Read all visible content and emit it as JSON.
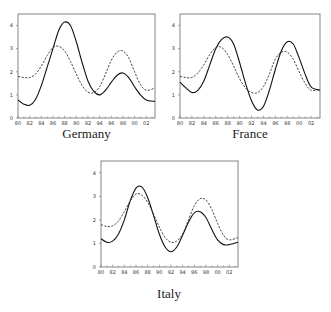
{
  "chart_data": [
    {
      "type": "line",
      "title": "Germany",
      "xlabel": "",
      "ylabel": "",
      "x_ticks": [
        "80",
        "82",
        "84",
        "86",
        "88",
        "90",
        "92",
        "94",
        "96",
        "98",
        "00",
        "02"
      ],
      "y_ticks": [
        0,
        1,
        2,
        3,
        4
      ],
      "xlim": [
        1980,
        2003.5
      ],
      "ylim": [
        0,
        4.5
      ],
      "grid": false,
      "legend": "none",
      "series": [
        {
          "name": "solid",
          "style": "solid",
          "x": [
            1980,
            1981,
            1982,
            1983,
            1984,
            1985,
            1986,
            1987,
            1988,
            1989,
            1990,
            1991,
            1992,
            1993,
            1994,
            1995,
            1996,
            1997,
            1998,
            1999,
            2000,
            2001,
            2002,
            2003.5
          ],
          "values": [
            0.78,
            0.6,
            0.55,
            0.8,
            1.4,
            2.2,
            3.0,
            3.8,
            4.15,
            4.0,
            3.3,
            2.4,
            1.6,
            1.15,
            1.0,
            1.2,
            1.55,
            1.85,
            1.95,
            1.75,
            1.35,
            1.0,
            0.78,
            0.72
          ]
        },
        {
          "name": "dashed",
          "style": "dashed",
          "x": [
            1980,
            1981,
            1982,
            1983,
            1984,
            1985,
            1986,
            1987,
            1988,
            1989,
            1990,
            1991,
            1992,
            1993,
            1994,
            1995,
            1996,
            1997,
            1998,
            1999,
            2000,
            2001,
            2002,
            2003.5
          ],
          "values": [
            1.8,
            1.75,
            1.75,
            1.9,
            2.25,
            2.7,
            3.05,
            3.1,
            2.9,
            2.45,
            1.9,
            1.4,
            1.12,
            1.1,
            1.35,
            1.9,
            2.5,
            2.85,
            2.9,
            2.6,
            2.0,
            1.45,
            1.2,
            1.3
          ]
        }
      ]
    },
    {
      "type": "line",
      "title": "France",
      "xlabel": "",
      "ylabel": "",
      "x_ticks": [
        "80",
        "82",
        "84",
        "86",
        "88",
        "90",
        "92",
        "94",
        "96",
        "98",
        "00",
        "02"
      ],
      "y_ticks": [
        0,
        1,
        2,
        3,
        4
      ],
      "xlim": [
        1980,
        2003.5
      ],
      "ylim": [
        0,
        4.5
      ],
      "grid": false,
      "legend": "none",
      "series": [
        {
          "name": "solid",
          "style": "solid",
          "x": [
            1980,
            1981,
            1982,
            1983,
            1984,
            1985,
            1986,
            1987,
            1988,
            1989,
            1990,
            1991,
            1992,
            1993,
            1994,
            1995,
            1996,
            1997,
            1998,
            1999,
            2000,
            2001,
            2002,
            2003.5
          ],
          "values": [
            1.55,
            1.3,
            1.1,
            1.2,
            1.6,
            2.3,
            3.0,
            3.4,
            3.5,
            3.2,
            2.4,
            1.5,
            0.75,
            0.35,
            0.5,
            1.2,
            2.1,
            2.9,
            3.3,
            3.2,
            2.6,
            1.9,
            1.35,
            1.2
          ]
        },
        {
          "name": "dashed",
          "style": "dashed",
          "x": [
            1980,
            1981,
            1982,
            1983,
            1984,
            1985,
            1986,
            1987,
            1988,
            1989,
            1990,
            1991,
            1992,
            1993,
            1994,
            1995,
            1996,
            1997,
            1998,
            1999,
            2000,
            2001,
            2002,
            2003.5
          ],
          "values": [
            1.8,
            1.75,
            1.75,
            1.95,
            2.3,
            2.75,
            3.05,
            3.05,
            2.75,
            2.25,
            1.7,
            1.3,
            1.1,
            1.1,
            1.35,
            1.9,
            2.55,
            2.85,
            2.85,
            2.55,
            2.0,
            1.5,
            1.2,
            1.25
          ]
        }
      ]
    },
    {
      "type": "line",
      "title": "Italy",
      "xlabel": "",
      "ylabel": "",
      "x_ticks": [
        "80",
        "82",
        "84",
        "86",
        "88",
        "90",
        "92",
        "94",
        "96",
        "98",
        "00",
        "02"
      ],
      "y_ticks": [
        0,
        1,
        2,
        3,
        4
      ],
      "xlim": [
        1980,
        2003.5
      ],
      "ylim": [
        0,
        4.5
      ],
      "grid": false,
      "legend": "none",
      "series": [
        {
          "name": "solid",
          "style": "solid",
          "x": [
            1980,
            1981,
            1982,
            1983,
            1984,
            1985,
            1986,
            1987,
            1988,
            1989,
            1990,
            1991,
            1992,
            1993,
            1994,
            1995,
            1996,
            1997,
            1998,
            1999,
            2000,
            2001,
            2002,
            2003.5
          ],
          "values": [
            1.2,
            1.05,
            1.1,
            1.4,
            2.0,
            2.8,
            3.35,
            3.4,
            2.95,
            2.2,
            1.4,
            0.85,
            0.65,
            0.85,
            1.35,
            1.9,
            2.3,
            2.35,
            2.1,
            1.6,
            1.15,
            0.95,
            0.95,
            1.05
          ]
        },
        {
          "name": "dashed",
          "style": "dashed",
          "x": [
            1980,
            1981,
            1982,
            1983,
            1984,
            1985,
            1986,
            1987,
            1988,
            1989,
            1990,
            1991,
            1992,
            1993,
            1994,
            1995,
            1996,
            1997,
            1998,
            1999,
            2000,
            2001,
            2002,
            2003.5
          ],
          "values": [
            1.8,
            1.72,
            1.75,
            1.95,
            2.35,
            2.8,
            3.1,
            3.05,
            2.75,
            2.25,
            1.7,
            1.25,
            1.05,
            1.1,
            1.4,
            2.0,
            2.6,
            2.9,
            2.85,
            2.45,
            1.85,
            1.35,
            1.15,
            1.25
          ]
        }
      ]
    }
  ],
  "captions": {
    "germany": "Germany",
    "france": "France",
    "italy": "Italy"
  }
}
